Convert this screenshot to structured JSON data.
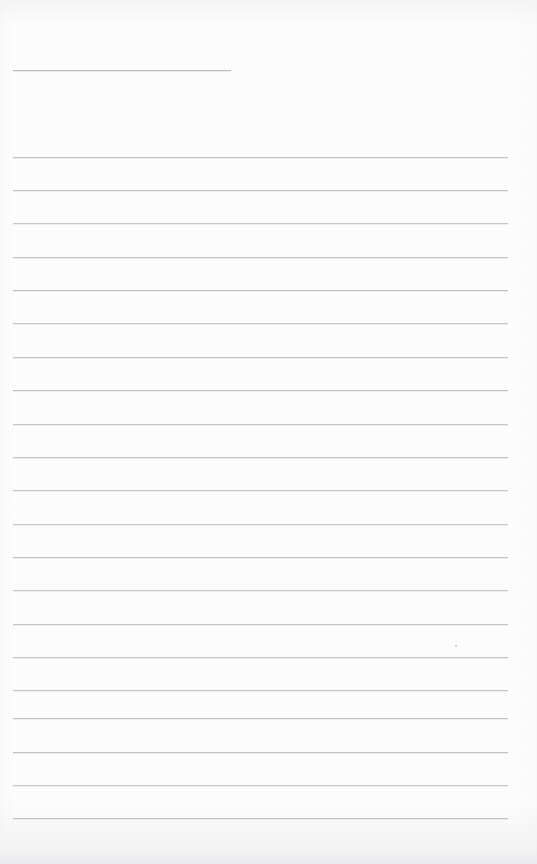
{
  "document": {
    "type": "ruled-notebook-page",
    "title": "",
    "body_text": "",
    "is_blank": true,
    "page_width": 537,
    "page_height": 864
  },
  "paper": {
    "background_color": "#fdfdfd",
    "edge_shadow_color": "#e8e9ec",
    "texture": "scan-grain"
  },
  "ruling": {
    "line_color": "#b9bdc1",
    "header_line_color": "#a9adb2",
    "line_thickness_px": 1,
    "line_spacing_px": 33.1,
    "left_margin_px": 13,
    "right_margin_px": 29,
    "header_rule": {
      "label": "header-rule",
      "y": 70,
      "x_start": 13,
      "x_end": 231,
      "written_value": ""
    },
    "body_rules": [
      {
        "label": "rule-1",
        "y": 157,
        "x_start": 13,
        "x_end": 508,
        "written_value": ""
      },
      {
        "label": "rule-2",
        "y": 190,
        "x_start": 13,
        "x_end": 508,
        "written_value": ""
      },
      {
        "label": "rule-3",
        "y": 223,
        "x_start": 13,
        "x_end": 508,
        "written_value": ""
      },
      {
        "label": "rule-4",
        "y": 257,
        "x_start": 13,
        "x_end": 508,
        "written_value": ""
      },
      {
        "label": "rule-5",
        "y": 290,
        "x_start": 13,
        "x_end": 508,
        "written_value": ""
      },
      {
        "label": "rule-6",
        "y": 323,
        "x_start": 13,
        "x_end": 508,
        "written_value": ""
      },
      {
        "label": "rule-7",
        "y": 357,
        "x_start": 13,
        "x_end": 508,
        "written_value": ""
      },
      {
        "label": "rule-8",
        "y": 390,
        "x_start": 13,
        "x_end": 508,
        "written_value": ""
      },
      {
        "label": "rule-9",
        "y": 424,
        "x_start": 13,
        "x_end": 508,
        "written_value": ""
      },
      {
        "label": "rule-10",
        "y": 457,
        "x_start": 13,
        "x_end": 508,
        "written_value": ""
      },
      {
        "label": "rule-11",
        "y": 490,
        "x_start": 13,
        "x_end": 508,
        "written_value": ""
      },
      {
        "label": "rule-12",
        "y": 524,
        "x_start": 13,
        "x_end": 508,
        "written_value": ""
      },
      {
        "label": "rule-13",
        "y": 557,
        "x_start": 13,
        "x_end": 508,
        "written_value": ""
      },
      {
        "label": "rule-14",
        "y": 590,
        "x_start": 13,
        "x_end": 508,
        "written_value": ""
      },
      {
        "label": "rule-15",
        "y": 624,
        "x_start": 13,
        "x_end": 508,
        "written_value": ""
      },
      {
        "label": "rule-16",
        "y": 657,
        "x_start": 13,
        "x_end": 508,
        "written_value": ""
      },
      {
        "label": "rule-17",
        "y": 690,
        "x_start": 13,
        "x_end": 508,
        "written_value": ""
      },
      {
        "label": "rule-18",
        "y": 718,
        "x_start": 13,
        "x_end": 508,
        "written_value": ""
      },
      {
        "label": "rule-19",
        "y": 752,
        "x_start": 13,
        "x_end": 508,
        "written_value": ""
      },
      {
        "label": "rule-20",
        "y": 785,
        "x_start": 13,
        "x_end": 508,
        "written_value": ""
      },
      {
        "label": "rule-21",
        "y": 818,
        "x_start": 13,
        "x_end": 508,
        "written_value": ""
      }
    ]
  },
  "marks": [
    {
      "label": "speck",
      "x": 455,
      "y": 645
    }
  ]
}
